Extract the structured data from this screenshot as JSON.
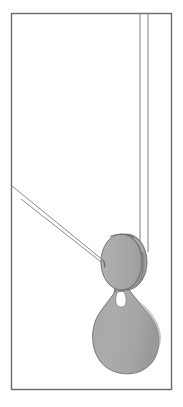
{
  "figure": {
    "title": "Pulley block with hook and rope",
    "canvas": {
      "width": 183,
      "height": 407,
      "background": "#ffffff"
    },
    "frame": {
      "name": "drawing-border",
      "x": 11,
      "y": 13,
      "width": 161,
      "height": 377,
      "stroke": "#6b6b6b",
      "stroke_width": 1.4,
      "fill": "none"
    },
    "colors": {
      "body_fill": "#a8a8a8",
      "body_fill_light": "#b4b4b4",
      "body_shade": "#8f8f8f",
      "body_shade_dark": "#7d7d7d",
      "outline": "#6e6e6e",
      "rope_stroke": "#8a8a8a",
      "highlight": "#ffffff"
    },
    "parts": [
      {
        "name": "sheave-wheel",
        "label": "Pulley sheave",
        "shape": "ellipse",
        "cx": 122,
        "cy": 262,
        "rx": 21,
        "ry": 28,
        "fill": "#a8a8a8"
      },
      {
        "name": "sheave-rim",
        "label": "Pulley side plate / rim",
        "shape": "crescent",
        "fill": "#8f8f8f"
      },
      {
        "name": "hook-neck",
        "label": "Hook shank",
        "shape": "tapered-neck",
        "x": 115,
        "y": 286,
        "width": 12,
        "height": 16,
        "fill": "#9f9f9f"
      },
      {
        "name": "hook-body",
        "label": "Teardrop hook body",
        "shape": "teardrop",
        "cx": 126,
        "cy": 338,
        "rx": 33,
        "ry": 31,
        "fill": "#a8a8a8"
      },
      {
        "name": "hook-eye",
        "label": "Hook eye opening",
        "shape": "slot",
        "cx": 121,
        "cy": 298,
        "rx": 4,
        "ry": 7,
        "fill": "#ffffff"
      }
    ],
    "ropes": [
      {
        "name": "vertical-rope",
        "label": "Vertical hoist rope",
        "orientation": "vertical",
        "lines": [
          {
            "x1": 140,
            "y1": 14,
            "x2": 140,
            "y2": 258
          },
          {
            "x1": 148,
            "y1": 14,
            "x2": 148,
            "y2": 252
          }
        ],
        "stroke": "#8a8a8a"
      },
      {
        "name": "diagonal-rope",
        "label": "Diagonal hauling rope",
        "orientation": "diagonal",
        "lines": [
          {
            "x1": 12,
            "y1": 186,
            "x2": 104,
            "y2": 261
          },
          {
            "x1": 21,
            "y1": 199,
            "x2": 105,
            "y2": 265
          }
        ],
        "stroke": "#8a8a8a"
      }
    ]
  }
}
